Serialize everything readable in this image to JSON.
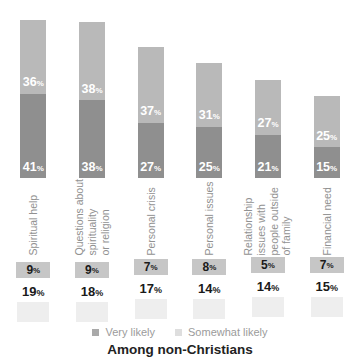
{
  "chart_data": {
    "type": "bar",
    "stacked": true,
    "orientation": "vertical",
    "unit": "%",
    "title": "Among non-Christians",
    "legend_position": "bottom",
    "grid": false,
    "ylim": [
      0,
      80
    ],
    "categories": [
      "Spiritual help",
      "Questions about\nspirituality\nor religion",
      "Personal crisis",
      "Personal issues",
      "Relationship\nissues with\npeople outside\nof family",
      "Financial need"
    ],
    "series": [
      {
        "name": "Somewhat likely",
        "role": "top-segment",
        "color": "#b9b9b9",
        "values": [
          36,
          38,
          37,
          31,
          27,
          25
        ]
      },
      {
        "name": "Very likely",
        "role": "bottom-segment",
        "color": "#8f8f8f",
        "values": [
          41,
          38,
          27,
          25,
          21,
          15
        ]
      }
    ],
    "boxed_row_values": [
      9,
      9,
      7,
      8,
      5,
      7
    ],
    "plain_row_values": [
      19,
      18,
      17,
      14,
      14,
      15
    ]
  },
  "legend": {
    "items": [
      {
        "label": "Very likely",
        "swatch_color": "#a9a9a9"
      },
      {
        "label": "Somewhat likely",
        "swatch_color": "#dedede"
      }
    ]
  },
  "footer": {
    "title": "Among non-Christians"
  },
  "colors": {
    "top_segment": "#b9b9b9",
    "bottom_segment": "#8f8f8f",
    "bar_value_text": "#ffffff",
    "boxed_row_bg": "#c6c6c6",
    "faint_box_bg": "#eeeeee",
    "category_text": "#919191",
    "number_text": "#1a1a1a",
    "legend_text": "#9b9b9b",
    "title_text": "#222222"
  }
}
